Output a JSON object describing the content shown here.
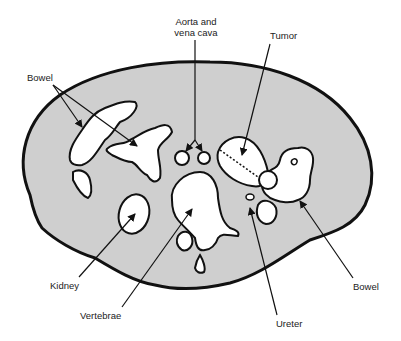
{
  "diagram": {
    "fill_color": "#cfcfcf",
    "outline_color": "#111111",
    "organ_color": "#ffffff",
    "labels": {
      "aorta_line1": "Aorta and",
      "aorta_line2": "vena cava",
      "tumor": "Tumor",
      "bowel_left": "Bowel",
      "kidney": "Kidney",
      "vertebrae": "Vertebrae",
      "ureter": "Ureter",
      "bowel_right": "Bowel"
    }
  }
}
